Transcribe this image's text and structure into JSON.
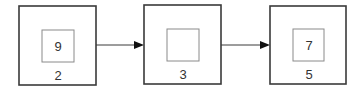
{
  "diagram": {
    "type": "linked-list",
    "nodes": [
      {
        "id": "node-1",
        "value": "9",
        "label": "2",
        "x": 19,
        "y": 6,
        "w": 77,
        "h": 79,
        "inner": {
          "x": 42,
          "y": 30,
          "w": 32,
          "h": 32
        }
      },
      {
        "id": "node-2",
        "value": "",
        "label": "3",
        "x": 144,
        "y": 5,
        "w": 77,
        "h": 79,
        "inner": {
          "x": 167,
          "y": 29,
          "w": 32,
          "h": 32
        }
      },
      {
        "id": "node-3",
        "value": "7",
        "label": "5",
        "x": 270,
        "y": 6,
        "w": 76,
        "h": 78,
        "inner": {
          "x": 293,
          "y": 29,
          "w": 31,
          "h": 32
        }
      }
    ],
    "edges": [
      {
        "from": "node-1",
        "to": "node-2",
        "x1": 96,
        "x2": 144,
        "y": 45
      },
      {
        "from": "node-2",
        "to": "node-3",
        "x1": 221,
        "x2": 270,
        "y": 45
      }
    ],
    "colors": {
      "outer_stroke": "#3a3a3a",
      "inner_stroke": "#8a8a8a",
      "text": "#333333",
      "arrow": "#111111"
    }
  }
}
